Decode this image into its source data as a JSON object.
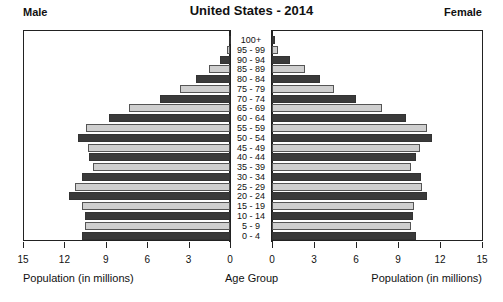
{
  "chart_data": {
    "type": "bar",
    "subtype": "population-pyramid",
    "title": "United States - 2014",
    "left_label": "Male",
    "right_label": "Female",
    "xlabel_left": "Population (in millions)",
    "xlabel_center": "Age Group",
    "xlabel_right": "Population (in millions)",
    "xlim": [
      0,
      15
    ],
    "xticks": [
      "15",
      "12",
      "9",
      "6",
      "3",
      "0"
    ],
    "xticks_right": [
      "0",
      "3",
      "6",
      "9",
      "12",
      "15"
    ],
    "categories": [
      "100+",
      "95 - 99",
      "90 - 94",
      "85 - 89",
      "80 - 84",
      "75 - 79",
      "70 - 74",
      "65 - 69",
      "60 - 64",
      "55 - 59",
      "50 - 54",
      "45 - 49",
      "40 - 44",
      "35 - 39",
      "30 - 34",
      "25 - 29",
      "20 - 24",
      "15 - 19",
      "10 - 14",
      "5 - 9",
      "0 - 4"
    ],
    "series": [
      {
        "name": "Male",
        "values": [
          0.1,
          0.2,
          0.7,
          1.5,
          2.5,
          3.6,
          5.1,
          7.3,
          8.8,
          10.4,
          11.0,
          10.3,
          10.2,
          9.9,
          10.7,
          11.2,
          11.7,
          10.7,
          10.5,
          10.5,
          10.7
        ]
      },
      {
        "name": "Female",
        "values": [
          0.2,
          0.4,
          1.3,
          2.4,
          3.5,
          4.5,
          6.1,
          8.0,
          9.7,
          11.2,
          11.6,
          10.7,
          10.4,
          10.1,
          10.8,
          10.9,
          11.2,
          10.3,
          10.2,
          10.1,
          10.4
        ]
      }
    ],
    "colors": {
      "dark": "#3a3a3a",
      "light": "#cfcfcf"
    },
    "grid": false,
    "legend": "none"
  }
}
